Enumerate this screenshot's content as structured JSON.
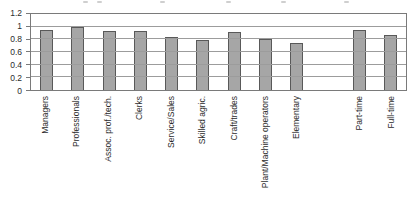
{
  "chart_data": {
    "type": "bar",
    "title": "",
    "xlabel": "",
    "ylabel": "",
    "categories": [
      "Managers",
      "Professionals",
      "Assoc. prof./tech.",
      "Clerks",
      "Service/Sales",
      "Skilled agric.",
      "Craft/trades",
      "Plant/Machine operators",
      "Elementary",
      "Part-time",
      "Full-time"
    ],
    "values": [
      0.94,
      1.0,
      0.93,
      0.93,
      0.83,
      0.79,
      0.92,
      0.81,
      0.75,
      0.94,
      0.87
    ],
    "ylim": [
      0,
      1.2
    ],
    "yticks": [
      0,
      0.2,
      0.4,
      0.6,
      0.8,
      1,
      1.2
    ],
    "ytick_labels": [
      "0",
      "0.2",
      "0.4",
      "0.6",
      "0.8",
      "1",
      "1.2"
    ],
    "grid": "horizontal",
    "legend": "none",
    "bar_color": "#a6a6a6",
    "bar_border_color": "#595959",
    "category_gap_after_index": 8
  }
}
